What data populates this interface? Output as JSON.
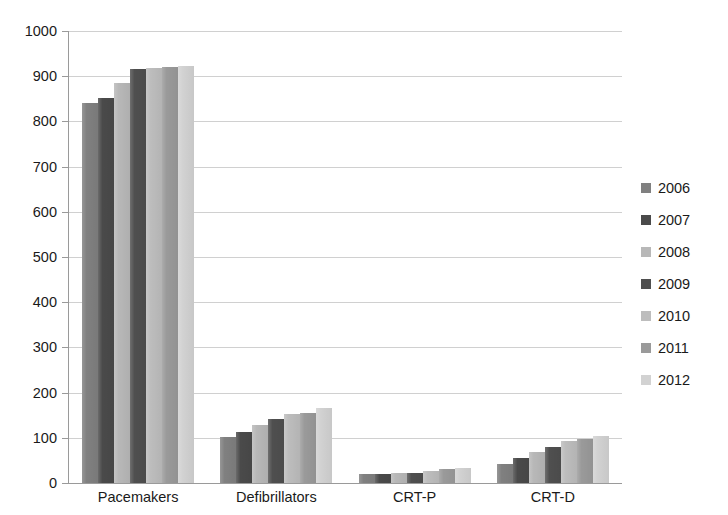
{
  "chart_data": {
    "type": "bar",
    "title": "",
    "subtitle": "",
    "xlabel": "",
    "ylabel": "",
    "categories": [
      "Pacemakers",
      "Defibrillators",
      "CRT-P",
      "CRT-D"
    ],
    "ylim": [
      0,
      1000
    ],
    "yticks": [
      0,
      100,
      200,
      300,
      400,
      500,
      600,
      700,
      800,
      900,
      1000
    ],
    "ytick_labels": [
      "0",
      "100",
      "200",
      "300",
      "400",
      "500",
      "600",
      "700",
      "800",
      "900",
      "1000"
    ],
    "grid": true,
    "legend_position": "right",
    "series": [
      {
        "name": "2006",
        "color": "#808080",
        "values": [
          840,
          101,
          20,
          42
        ]
      },
      {
        "name": "2007",
        "color": "#4a4a4a",
        "values": [
          852,
          113,
          21,
          55
        ]
      },
      {
        "name": "2008",
        "color": "#b8b8b8",
        "values": [
          885,
          128,
          22,
          68
        ]
      },
      {
        "name": "2009",
        "color": "#4f4f4f",
        "values": [
          917,
          141,
          23,
          79
        ]
      },
      {
        "name": "2010",
        "color": "#bdbdbd",
        "values": [
          919,
          152,
          27,
          92
        ]
      },
      {
        "name": "2011",
        "color": "#9a9a9a",
        "values": [
          921,
          156,
          30,
          98
        ]
      },
      {
        "name": "2012",
        "color": "#d2d2d2",
        "values": [
          922,
          165,
          33,
          103
        ]
      }
    ]
  },
  "axes": {
    "grid_color": "#d0d0d0",
    "axis_color": "#9a9a9a"
  }
}
